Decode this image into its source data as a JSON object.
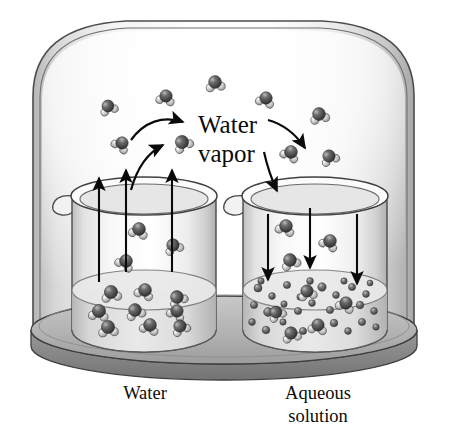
{
  "figure": {
    "type": "scientific-illustration",
    "background_color": "#ffffff",
    "ink_color": "#111111"
  },
  "labels": {
    "vapor_line1": "Water",
    "vapor_line2": "vapor",
    "caption_left": "Water",
    "caption_right_line1": "Aqueous",
    "caption_right_line2": "solution"
  },
  "apparatus": {
    "bell_jar": {
      "name": "bell-jar",
      "glass_stroke": "#3a3a3a",
      "fill_top": "#ffffff",
      "fill_edge": "#c9c9c9"
    },
    "base_plate": {
      "name": "base-plate",
      "fill": "#b9b9b9",
      "edge": "#8d8d8d",
      "stroke": "#4a4a4a"
    },
    "beakers": [
      {
        "id": "left",
        "name": "beaker-water",
        "contents": "pure water",
        "arrow_direction": "up",
        "arrow_count": 3,
        "spout_side": "left"
      },
      {
        "id": "right",
        "name": "beaker-aqueous-solution",
        "contents": "aqueous solution",
        "arrow_direction": "down",
        "arrow_count": 3,
        "spout_side": "left"
      }
    ]
  },
  "colors": {
    "oxygen": "#555555",
    "oxygen_dark": "#3c3c3c",
    "hydrogen": "#c7c7c7",
    "solute": "#6e6e6e",
    "solute_light": "#9a9a9a",
    "arrow": "#0a0a0a",
    "glass": "#8f8f8f",
    "water_fill": "#d4d4d4"
  },
  "curved_arrows": [
    {
      "name": "curved-arrow-evaporate-1",
      "direction": "up-right",
      "from": "left-beaker",
      "to": "vapor-label"
    },
    {
      "name": "curved-arrow-evaporate-2",
      "direction": "up-right",
      "from": "left-beaker",
      "to": "vapor-region"
    },
    {
      "name": "curved-arrow-condense-1",
      "direction": "down-right",
      "from": "vapor-label",
      "to": "right-beaker"
    },
    {
      "name": "curved-arrow-condense-2",
      "direction": "down-right",
      "from": "vapor-region",
      "to": "right-beaker"
    }
  ],
  "straight_arrows": {
    "left_beaker_up": 3,
    "right_beaker_down": 3,
    "above_left_beaker_up": 3
  },
  "molecules": {
    "vapor_water_molecules": [
      {
        "x": 108,
        "y": 106,
        "r": 6.0,
        "rot": -20
      },
      {
        "x": 166,
        "y": 96,
        "r": 6.2,
        "rot": 12
      },
      {
        "x": 215,
        "y": 82,
        "r": 6.4,
        "rot": -8
      },
      {
        "x": 122,
        "y": 143,
        "r": 6.2,
        "rot": 35
      },
      {
        "x": 182,
        "y": 142,
        "r": 6.6,
        "rot": -30
      },
      {
        "x": 266,
        "y": 98,
        "r": 6.2,
        "rot": 18
      },
      {
        "x": 319,
        "y": 114,
        "r": 6.4,
        "rot": -14
      },
      {
        "x": 291,
        "y": 152,
        "r": 6.4,
        "rot": 26
      },
      {
        "x": 329,
        "y": 156,
        "r": 6.2,
        "rot": -24
      }
    ],
    "left_beaker_vapor": [
      {
        "x": 139,
        "y": 229,
        "r": 6.4,
        "rot": 14
      },
      {
        "x": 173,
        "y": 245,
        "r": 6.2,
        "rot": -22
      },
      {
        "x": 126,
        "y": 261,
        "r": 6.4,
        "rot": 30
      }
    ],
    "left_beaker_liquid": [
      {
        "x": 111,
        "y": 292,
        "r": 6.6,
        "rot": -10
      },
      {
        "x": 145,
        "y": 290,
        "r": 6.4,
        "rot": 20
      },
      {
        "x": 177,
        "y": 297,
        "r": 6.4,
        "rot": -28
      },
      {
        "x": 99,
        "y": 311,
        "r": 6.6,
        "rot": 8
      },
      {
        "x": 135,
        "y": 310,
        "r": 6.4,
        "rot": -18
      },
      {
        "x": 177,
        "y": 311,
        "r": 6.2,
        "rot": 24
      },
      {
        "x": 108,
        "y": 327,
        "r": 6.6,
        "rot": -6
      },
      {
        "x": 150,
        "y": 325,
        "r": 6.4,
        "rot": 16
      },
      {
        "x": 180,
        "y": 326,
        "r": 6.2,
        "rot": -26
      }
    ],
    "right_beaker_vapor": [
      {
        "x": 286,
        "y": 226,
        "r": 6.4,
        "rot": 18
      },
      {
        "x": 290,
        "y": 260,
        "r": 6.4,
        "rot": -20
      },
      {
        "x": 330,
        "y": 241,
        "r": 6.4,
        "rot": 26
      }
    ],
    "right_beaker_liquid_water": [
      {
        "x": 307,
        "y": 291,
        "r": 6.2,
        "rot": -12
      },
      {
        "x": 346,
        "y": 303,
        "r": 6.2,
        "rot": 22
      },
      {
        "x": 276,
        "y": 312,
        "r": 6.0,
        "rot": -30
      },
      {
        "x": 318,
        "y": 325,
        "r": 6.2,
        "rot": 10
      },
      {
        "x": 291,
        "y": 333,
        "r": 6.2,
        "rot": -16
      }
    ],
    "solute_particles": [
      {
        "x": 258,
        "y": 288,
        "r": 4.0
      },
      {
        "x": 272,
        "y": 296,
        "r": 3.4
      },
      {
        "x": 287,
        "y": 285,
        "r": 3.6
      },
      {
        "x": 300,
        "y": 297,
        "r": 3.2
      },
      {
        "x": 322,
        "y": 287,
        "r": 4.2
      },
      {
        "x": 336,
        "y": 295,
        "r": 3.4
      },
      {
        "x": 352,
        "y": 287,
        "r": 3.6
      },
      {
        "x": 366,
        "y": 294,
        "r": 3.4
      },
      {
        "x": 254,
        "y": 305,
        "r": 3.6
      },
      {
        "x": 268,
        "y": 312,
        "r": 4.4
      },
      {
        "x": 284,
        "y": 304,
        "r": 3.2
      },
      {
        "x": 298,
        "y": 311,
        "r": 3.6
      },
      {
        "x": 312,
        "y": 303,
        "r": 3.4
      },
      {
        "x": 330,
        "y": 310,
        "r": 3.6
      },
      {
        "x": 360,
        "y": 305,
        "r": 3.8
      },
      {
        "x": 374,
        "y": 311,
        "r": 3.4
      },
      {
        "x": 252,
        "y": 322,
        "r": 3.4
      },
      {
        "x": 266,
        "y": 330,
        "r": 3.8
      },
      {
        "x": 283,
        "y": 322,
        "r": 3.2
      },
      {
        "x": 303,
        "y": 331,
        "r": 3.6
      },
      {
        "x": 334,
        "y": 323,
        "r": 3.8
      },
      {
        "x": 348,
        "y": 331,
        "r": 3.4
      },
      {
        "x": 362,
        "y": 322,
        "r": 3.6
      },
      {
        "x": 376,
        "y": 327,
        "r": 3.2
      },
      {
        "x": 261,
        "y": 281,
        "r": 3.2
      },
      {
        "x": 310,
        "y": 281,
        "r": 3.4
      },
      {
        "x": 344,
        "y": 281,
        "r": 3.2
      },
      {
        "x": 370,
        "y": 283,
        "r": 3.0
      }
    ]
  },
  "geometry": {
    "canvas": {
      "width": 449,
      "height": 431
    },
    "bell_jar": {
      "left": 30,
      "right": 416,
      "top": 18,
      "bottom": 340
    },
    "base": {
      "cx": 224,
      "cy": 330,
      "rx": 193,
      "ry": 34
    },
    "left_beaker": {
      "cx": 144,
      "top": 191,
      "bottom": 341,
      "rx": 72
    },
    "right_beaker": {
      "cx": 315,
      "top": 191,
      "bottom": 341,
      "rx": 72
    },
    "water_level_y": 290
  }
}
